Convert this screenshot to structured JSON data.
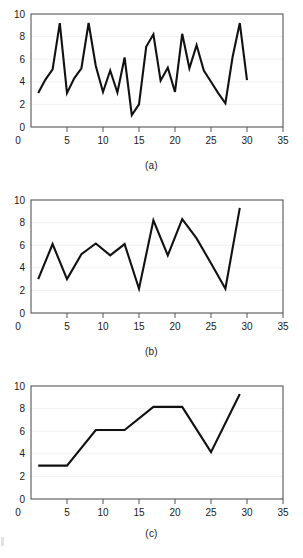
{
  "figure": {
    "background_color": "#ffffff",
    "line_color": "#111111",
    "grid_color": "#ececec",
    "axis_color": "#555555"
  },
  "panels": [
    {
      "caption": "(a)"
    },
    {
      "caption": "(b)"
    },
    {
      "caption": "(c)"
    }
  ],
  "chart_data": [
    {
      "type": "line",
      "title": "",
      "caption": "(a)",
      "xlabel": "",
      "ylabel": "",
      "xlim": [
        0,
        35
      ],
      "ylim": [
        0,
        10
      ],
      "xticks": [
        0,
        5,
        10,
        15,
        20,
        25,
        30,
        35
      ],
      "yticks": [
        0,
        2,
        4,
        6,
        8,
        10
      ],
      "xtick_labels": [
        "0",
        "5",
        "10",
        "15",
        "20",
        "25",
        "30",
        "35"
      ],
      "ytick_labels": [
        "0",
        "2",
        "4",
        "6",
        "8",
        "10"
      ],
      "grid": "horizontal",
      "legend": "none",
      "x": [
        1,
        2,
        3,
        4,
        5,
        6,
        7,
        8,
        9,
        10,
        11,
        12,
        13,
        14,
        15,
        16,
        17,
        18,
        19,
        20,
        21,
        22,
        23,
        24,
        25,
        26,
        27,
        28,
        29,
        30
      ],
      "values": [
        3.0,
        4.2,
        5.1,
        9.2,
        3.0,
        4.3,
        5.2,
        9.2,
        5.4,
        3.1,
        5.0,
        3.05,
        6.15,
        1.05,
        2.0,
        7.1,
        8.2,
        4.1,
        5.25,
        3.1,
        8.25,
        5.2,
        7.25,
        5.0,
        4.0,
        3.0,
        2.1,
        6.2,
        9.2,
        4.15
      ]
    },
    {
      "type": "line",
      "title": "",
      "caption": "(b)",
      "xlabel": "",
      "ylabel": "",
      "xlim": [
        0,
        35
      ],
      "ylim": [
        0,
        10
      ],
      "xticks": [
        0,
        5,
        10,
        15,
        20,
        25,
        30,
        35
      ],
      "yticks": [
        0,
        2,
        4,
        6,
        8,
        10
      ],
      "xtick_labels": [
        "0",
        "5",
        "10",
        "15",
        "20",
        "25",
        "30",
        "35"
      ],
      "ytick_labels": [
        "0",
        "2",
        "4",
        "6",
        "8",
        "10"
      ],
      "grid": "horizontal",
      "legend": "none",
      "x": [
        1,
        3,
        5,
        7,
        9,
        11,
        13,
        15,
        17,
        19,
        21,
        23,
        25,
        27,
        29
      ],
      "values": [
        3.0,
        6.1,
        3.0,
        5.2,
        6.15,
        5.1,
        6.1,
        2.15,
        8.2,
        5.1,
        8.3,
        6.6,
        4.4,
        2.15,
        9.3
      ]
    },
    {
      "type": "line",
      "title": "",
      "caption": "(c)",
      "xlabel": "",
      "ylabel": "",
      "xlim": [
        0,
        35
      ],
      "ylim": [
        0,
        10
      ],
      "xticks": [
        0,
        5,
        10,
        15,
        20,
        25,
        30,
        35
      ],
      "yticks": [
        0,
        2,
        4,
        6,
        8,
        10
      ],
      "xtick_labels": [
        "0",
        "5",
        "10",
        "15",
        "20",
        "25",
        "30",
        "35"
      ],
      "ytick_labels": [
        "0",
        "2",
        "4",
        "6",
        "8",
        "10"
      ],
      "grid": "horizontal",
      "legend": "none",
      "x": [
        1,
        5,
        9,
        13,
        17,
        21,
        25,
        29
      ],
      "values": [
        2.95,
        2.95,
        6.1,
        6.1,
        8.15,
        8.15,
        4.15,
        9.3
      ]
    }
  ]
}
